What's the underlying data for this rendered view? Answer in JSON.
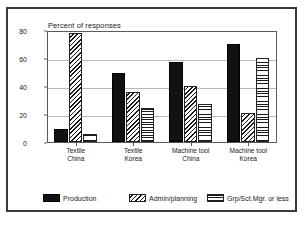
{
  "chart_data": {
    "type": "bar",
    "title": "",
    "xlabel": "",
    "ylabel": "Percent of responses",
    "ylim": [
      0,
      80
    ],
    "yticks": [
      0,
      20,
      40,
      60,
      80
    ],
    "grid": true,
    "legend_position": "bottom",
    "categories": [
      "Textile\nChina",
      "Textile\nKorea",
      "Machine tool\nChina",
      "Machine tool\nKorea"
    ],
    "category_lines": [
      [
        "Textile",
        "China"
      ],
      [
        "Textile",
        "Korea"
      ],
      [
        "Machine tool",
        "China"
      ],
      [
        "Machine tool",
        "Korea"
      ]
    ],
    "series": [
      {
        "name": "Production",
        "pattern": "solid-black",
        "values": [
          9,
          49,
          57,
          70
        ]
      },
      {
        "name": "Admin/planning",
        "pattern": "diagonal-hatch",
        "values": [
          78,
          36,
          40,
          21
        ]
      },
      {
        "name": "Grp/Sct.Mgr. or less",
        "pattern": "cross-hatch-grid",
        "values": [
          6,
          24,
          27,
          60
        ]
      }
    ]
  },
  "axis": {
    "y_title": "Percent of responses",
    "tick_labels": [
      "80",
      "60",
      "40",
      "20",
      "0"
    ]
  },
  "legend": {
    "items": [
      {
        "label": "Production"
      },
      {
        "label": "Admin/planning"
      },
      {
        "label": "Grp/Sct.Mgr. or less"
      }
    ]
  },
  "caption": {
    "sliver_text": ""
  },
  "colors": {
    "frame": "#3a3a3a",
    "axis": "#5a5a5a",
    "grid": "#b9b9b9",
    "ink": "#1a1a1a",
    "background": "#ffffff"
  }
}
